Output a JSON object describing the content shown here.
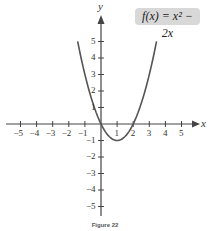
{
  "chart_data": {
    "type": "line",
    "title": "",
    "function_label": "f(x) = x² − 2x",
    "xlabel": "x",
    "ylabel": "y",
    "xlim": [
      -5.8,
      6
    ],
    "ylim": [
      -5.8,
      6
    ],
    "x_ticks": [
      -5,
      -4,
      -3,
      -2,
      -1,
      1,
      2,
      3,
      4,
      5
    ],
    "y_ticks": [
      -5,
      -4,
      -3,
      -2,
      -1,
      1,
      2,
      3,
      4,
      5
    ],
    "x_tick_labels": [
      "−5",
      "−4",
      "−3",
      "−2",
      "−1",
      "1",
      "2",
      "3",
      "4",
      "5"
    ],
    "y_tick_labels": [
      "−5",
      "−4",
      "−3",
      "−2",
      "−1",
      "1",
      "2",
      "3",
      "4",
      "5"
    ],
    "grid": false,
    "series": [
      {
        "name": "f(x) = x² − 2x",
        "x": [
          -1.45,
          -1,
          -0.5,
          0,
          0.5,
          1,
          1.5,
          2,
          2.5,
          3,
          3.45
        ],
        "y": [
          5,
          3,
          1.25,
          0,
          -0.75,
          -1,
          -0.75,
          0,
          1.25,
          3,
          5
        ],
        "color": "#555555"
      }
    ],
    "annotations": [
      "vertex at (1, −1)",
      "x-intercepts at 0 and 2"
    ]
  },
  "caption": "Figure 22"
}
